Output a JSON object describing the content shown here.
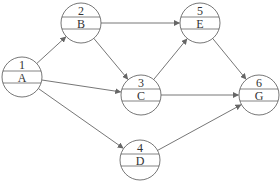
{
  "diagram": {
    "type": "activity-on-node network",
    "nodes": [
      {
        "id": "1",
        "label": "A",
        "cx": 22,
        "cy": 77
      },
      {
        "id": "2",
        "label": "B",
        "cx": 81,
        "cy": 23
      },
      {
        "id": "3",
        "label": "C",
        "cx": 141,
        "cy": 95
      },
      {
        "id": "4",
        "label": "D",
        "cx": 140,
        "cy": 160
      },
      {
        "id": "5",
        "label": "E",
        "cx": 200,
        "cy": 23
      },
      {
        "id": "6",
        "label": "G",
        "cx": 259,
        "cy": 95
      }
    ],
    "edges": [
      {
        "from": "1",
        "to": "2"
      },
      {
        "from": "1",
        "to": "3"
      },
      {
        "from": "1",
        "to": "4"
      },
      {
        "from": "2",
        "to": "3"
      },
      {
        "from": "2",
        "to": "5"
      },
      {
        "from": "3",
        "to": "5"
      },
      {
        "from": "3",
        "to": "6"
      },
      {
        "from": "5",
        "to": "6"
      },
      {
        "from": "4",
        "to": "6"
      }
    ],
    "colors": {
      "stroke": "#666666",
      "text": "#333333"
    },
    "node_radius": 20
  },
  "caption": {
    "text": ""
  }
}
